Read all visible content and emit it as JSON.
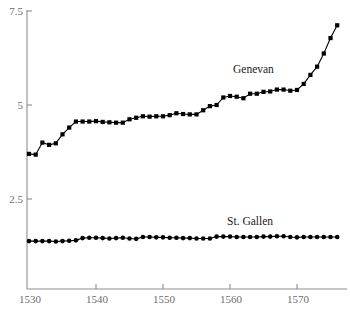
{
  "chart_data": {
    "type": "line",
    "title": "",
    "subtitle": "",
    "xlabel": "",
    "ylabel": "",
    "xlim": [
      1529,
      1577
    ],
    "ylim": [
      0,
      7.5
    ],
    "grid": false,
    "legend_position": "inline-annotation",
    "y_ticks": [
      {
        "value": 7.5,
        "label": "7.5"
      },
      {
        "value": 5,
        "label": "5"
      },
      {
        "value": 2.5,
        "label": "2.5"
      }
    ],
    "x_ticks": [
      {
        "value": 1530,
        "label": "1530"
      },
      {
        "value": 1540,
        "label": "1540"
      },
      {
        "value": 1550,
        "label": "1550"
      },
      {
        "value": 1560,
        "label": "1560"
      },
      {
        "value": 1570,
        "label": "1570"
      }
    ],
    "x": [
      1530,
      1531,
      1532,
      1533,
      1534,
      1535,
      1536,
      1537,
      1538,
      1539,
      1540,
      1541,
      1542,
      1543,
      1544,
      1545,
      1546,
      1547,
      1548,
      1549,
      1550,
      1551,
      1552,
      1553,
      1554,
      1555,
      1556,
      1557,
      1558,
      1559,
      1560,
      1561,
      1562,
      1563,
      1564,
      1565,
      1566,
      1567,
      1568,
      1569,
      1570,
      1571,
      1572,
      1573,
      1574,
      1575,
      1576
    ],
    "series": [
      {
        "name": "Genevan",
        "marker": "square",
        "label_x": 1563.5,
        "label_y": 5.85,
        "values": [
          3.7,
          3.68,
          4.0,
          3.94,
          3.98,
          4.22,
          4.4,
          4.56,
          4.56,
          4.56,
          4.57,
          4.55,
          4.54,
          4.53,
          4.53,
          4.62,
          4.66,
          4.7,
          4.69,
          4.7,
          4.7,
          4.73,
          4.78,
          4.76,
          4.75,
          4.75,
          4.86,
          4.97,
          5.0,
          5.2,
          5.24,
          5.22,
          5.18,
          5.3,
          5.3,
          5.35,
          5.36,
          5.41,
          5.41,
          5.38,
          5.4,
          5.56,
          5.8,
          6.02,
          6.37,
          6.78,
          7.12
        ]
      },
      {
        "name": "St. Gallen",
        "marker": "circle",
        "label_x": 1563.0,
        "label_y": 1.82,
        "values": [
          1.38,
          1.38,
          1.38,
          1.38,
          1.37,
          1.38,
          1.39,
          1.4,
          1.46,
          1.47,
          1.47,
          1.46,
          1.45,
          1.46,
          1.47,
          1.45,
          1.44,
          1.49,
          1.49,
          1.48,
          1.48,
          1.47,
          1.47,
          1.46,
          1.46,
          1.45,
          1.45,
          1.45,
          1.5,
          1.5,
          1.5,
          1.49,
          1.49,
          1.49,
          1.49,
          1.5,
          1.5,
          1.51,
          1.51,
          1.49,
          1.48,
          1.49,
          1.49,
          1.49,
          1.49,
          1.49,
          1.49
        ]
      }
    ]
  },
  "colors": {
    "axis": "#8d8d8d",
    "tick_text": "#6d6d6d",
    "series": "#000000",
    "background": "#ffffff"
  }
}
